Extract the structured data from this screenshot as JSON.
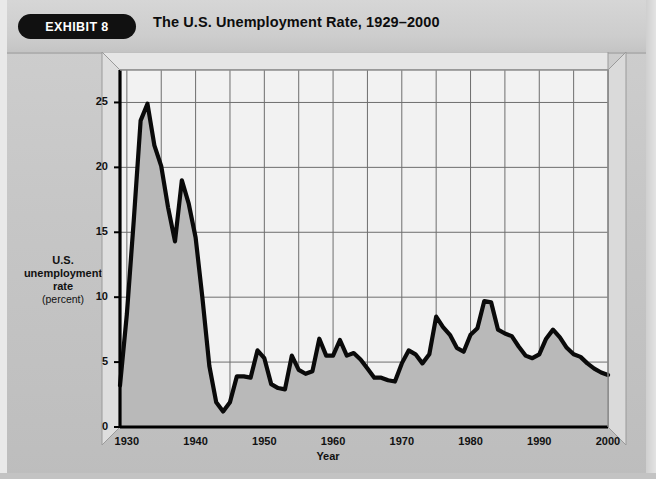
{
  "header": {
    "badge_label": "EXHIBIT 8",
    "title": "The U.S. Unemployment Rate, 1929–2000"
  },
  "axis": {
    "y_label_line1": "U.S.",
    "y_label_line2": "unemployment",
    "y_label_line3": "rate",
    "y_label_unit": "(percent)",
    "x_label": "Year"
  },
  "colors": {
    "page_background": "#c8c8c8",
    "header_background": "#d2d2d2",
    "badge_background": "#111111",
    "badge_text": "#ffffff",
    "plot_background_upper": "#f2f2f2",
    "plot_fill_lower": "#b9b9b9",
    "line": "#0a0a0a",
    "gridline": "#6e6e6e",
    "axis": "#000000",
    "bevel": "#e6e6e6"
  },
  "chart_data": {
    "type": "line",
    "title": "The U.S. Unemployment Rate, 1929–2000",
    "xlabel": "Year",
    "ylabel": "U.S. unemployment rate (percent)",
    "xlim": [
      1929,
      2000
    ],
    "ylim": [
      0,
      27.5
    ],
    "yticks": [
      0,
      5,
      10,
      15,
      20,
      25
    ],
    "xticks": [
      1930,
      1940,
      1950,
      1960,
      1970,
      1980,
      1990,
      2000
    ],
    "grid": true,
    "grid_x_interval": 5,
    "grid_y_interval": 5,
    "legend": false,
    "series_name": "U.S. unemployment rate",
    "x": [
      1929,
      1930,
      1931,
      1932,
      1933,
      1934,
      1935,
      1936,
      1937,
      1938,
      1939,
      1940,
      1941,
      1942,
      1943,
      1944,
      1945,
      1946,
      1947,
      1948,
      1949,
      1950,
      1951,
      1952,
      1953,
      1954,
      1955,
      1956,
      1957,
      1958,
      1959,
      1960,
      1961,
      1962,
      1963,
      1964,
      1965,
      1966,
      1967,
      1968,
      1969,
      1970,
      1971,
      1972,
      1973,
      1974,
      1975,
      1976,
      1977,
      1978,
      1979,
      1980,
      1981,
      1982,
      1983,
      1984,
      1985,
      1986,
      1987,
      1988,
      1989,
      1990,
      1991,
      1992,
      1993,
      1994,
      1995,
      1996,
      1997,
      1998,
      1999,
      2000
    ],
    "values": [
      3.2,
      8.7,
      15.9,
      23.6,
      24.9,
      21.7,
      20.1,
      16.9,
      14.3,
      19.0,
      17.2,
      14.6,
      9.9,
      4.7,
      1.9,
      1.2,
      1.9,
      3.9,
      3.9,
      3.8,
      5.9,
      5.3,
      3.3,
      3.0,
      2.9,
      5.5,
      4.4,
      4.1,
      4.3,
      6.8,
      5.5,
      5.5,
      6.7,
      5.5,
      5.7,
      5.2,
      4.5,
      3.8,
      3.8,
      3.6,
      3.5,
      4.9,
      5.9,
      5.6,
      4.9,
      5.6,
      8.5,
      7.7,
      7.1,
      6.1,
      5.8,
      7.1,
      7.6,
      9.7,
      9.6,
      7.5,
      7.2,
      7.0,
      6.2,
      5.5,
      5.3,
      5.6,
      6.8,
      7.5,
      6.9,
      6.1,
      5.6,
      5.4,
      4.9,
      4.5,
      4.2,
      4.0
    ]
  }
}
